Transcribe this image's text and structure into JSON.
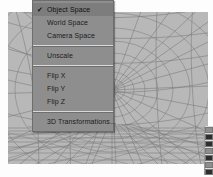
{
  "app": {
    "title": "3D viewport with context menu"
  },
  "viewport": {
    "name": "3d-viewport",
    "background_color": "#b8b8b8",
    "wire_color": "#6e6e6e",
    "description": "perspective wireframe: radial hemisphere lattice and ground grid"
  },
  "context_menu": {
    "name": "transform-space-context-menu",
    "background_color": "#8e8e8e",
    "highlight_color": "#7d7d7d",
    "text_color": "#1c1c1c",
    "check_glyph": "✔",
    "groups": [
      {
        "items": [
          {
            "label": "Object Space",
            "checked": true
          },
          {
            "label": "World Space",
            "checked": false
          },
          {
            "label": "Camera Space",
            "checked": false
          }
        ]
      },
      {
        "items": [
          {
            "label": "Unscale",
            "checked": false
          }
        ]
      },
      {
        "items": [
          {
            "label": "Flip X",
            "checked": false
          },
          {
            "label": "Flip Y",
            "checked": false
          },
          {
            "label": "Flip Z",
            "checked": false
          }
        ]
      },
      {
        "items": [
          {
            "label": "3D Transformations...",
            "checked": false
          }
        ]
      }
    ]
  },
  "edge_toolbar": {
    "name": "right-edge-toolbar",
    "buttons": [
      {
        "icon": "tool-button-1-icon",
        "tone": "lite"
      },
      {
        "icon": "tool-button-2-icon",
        "tone": "dark"
      },
      {
        "icon": "tool-button-3-icon",
        "tone": "dark"
      },
      {
        "icon": "tool-button-4-icon",
        "tone": "lite"
      },
      {
        "icon": "tool-button-5-icon",
        "tone": "dark"
      },
      {
        "icon": "tool-button-6-icon",
        "tone": "lite"
      },
      {
        "icon": "tool-button-7-icon",
        "tone": "dark"
      }
    ]
  }
}
